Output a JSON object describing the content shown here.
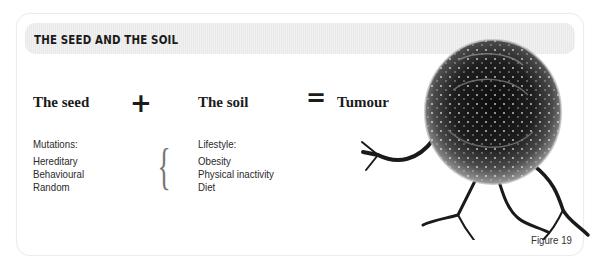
{
  "header": {
    "title": "THE SEED AND THE SOIL"
  },
  "equation": {
    "seed_label": "The seed",
    "plus_symbol": "+",
    "soil_label": "The soil",
    "equals_symbol": "=",
    "result_label": "Tumour"
  },
  "seed_column": {
    "heading": "Mutations:",
    "items": [
      "Hereditary",
      "Behavioural",
      "Random"
    ]
  },
  "brace_symbol": "{",
  "soil_column": {
    "heading": "Lifestyle:",
    "items": [
      "Obesity",
      "Physical inactivity",
      "Diet"
    ]
  },
  "figure": {
    "label": "Figure 19"
  },
  "illustration": {
    "name": "tumour-cell-illustration"
  }
}
